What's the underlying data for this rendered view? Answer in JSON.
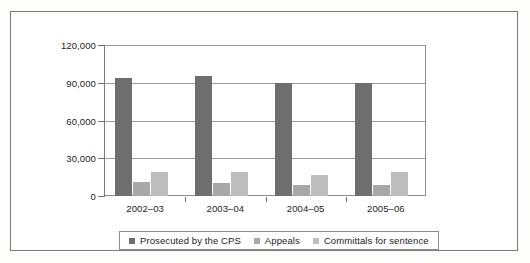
{
  "chart_data": {
    "type": "bar",
    "title": "",
    "subtitle": "",
    "xlabel": "",
    "ylabel": "",
    "categories": [
      "2002–03",
      "2003–04",
      "2004–05",
      "2005–06"
    ],
    "series": [
      {
        "name": "Prosecuted by the CPS",
        "color": "#6e6e6e",
        "values": [
          94000,
          95000,
          90000,
          90000
        ]
      },
      {
        "name": "Appeals",
        "color": "#a8a8a8",
        "values": [
          11000,
          10500,
          9000,
          8500
        ]
      },
      {
        "name": "Committals for sentence",
        "color": "#bdbdbd",
        "values": [
          19000,
          19000,
          17000,
          19000
        ]
      }
    ],
    "ylim": [
      0,
      120000
    ],
    "yticks": [
      0,
      30000,
      60000,
      90000,
      120000
    ],
    "ytick_labels": [
      "0",
      "30,000",
      "60,000",
      "90,000",
      "120,000"
    ],
    "grid": true,
    "grid_axis": "y",
    "legend": true,
    "legend_position": "bottom"
  },
  "figure": {
    "border_color": "#7b7b7b",
    "background": "#ffffff"
  }
}
